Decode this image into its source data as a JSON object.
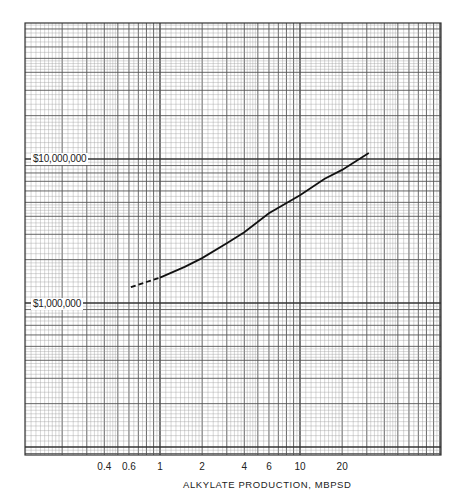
{
  "chart_data": {
    "type": "line",
    "title": "",
    "xlabel": "ALKYLATE PRODUCTION, MBPSD",
    "ylabel": "",
    "xscale": "log",
    "yscale": "log",
    "grid": true,
    "xlim": [
      0.1,
      60
    ],
    "ylim": [
      100000,
      50000000
    ],
    "x_tick_labels": [
      "0.4",
      "0.6",
      "1",
      "2",
      "4",
      "6",
      "10",
      "20"
    ],
    "x_tick_values": [
      0.4,
      0.6,
      1,
      2,
      4,
      6,
      10,
      20
    ],
    "y_tick_labels": [
      "$10,000,000",
      "$1,000,000"
    ],
    "y_tick_values": [
      10000000,
      1000000
    ],
    "series": [
      {
        "name": "Investment cost",
        "x": [
          0.62,
          0.8,
          1,
          1.5,
          2,
          3,
          4,
          6,
          10,
          15,
          20,
          31
        ],
        "y": [
          1290000,
          1400000,
          1500000,
          1780000,
          2050000,
          2600000,
          3100000,
          4200000,
          5600000,
          7300000,
          8400000,
          11000000
        ],
        "dashed_below_x": 0.9
      }
    ]
  },
  "labels": {
    "y_top": "$10,000,000",
    "y_bottom": "$1,000,000",
    "x_title": "ALKYLATE PRODUCTION, MBPSD",
    "x_ticks": [
      "0.4",
      "0.6",
      "1",
      "2",
      "4",
      "6",
      "10",
      "20"
    ]
  }
}
